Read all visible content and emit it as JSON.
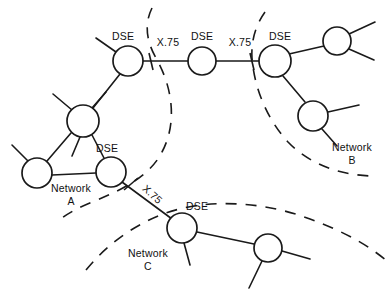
{
  "diagram": {
    "background_color": "#ffffff",
    "line_color": "#1a1a1a",
    "width": 390,
    "height": 305,
    "nodes": [
      {
        "id": "n-a-dse-top",
        "label": "DSE",
        "label_pos": "above-left",
        "cx": 128,
        "cy": 61,
        "r": 15
      },
      {
        "id": "n-a-mid",
        "label": "",
        "label_pos": "",
        "cx": 83,
        "cy": 121,
        "r": 16
      },
      {
        "id": "n-a-left",
        "label": "",
        "label_pos": "",
        "cx": 37,
        "cy": 173,
        "r": 15
      },
      {
        "id": "n-a-dse-bottom",
        "label": "DSE",
        "label_pos": "above-left",
        "cx": 111,
        "cy": 172,
        "r": 15
      },
      {
        "id": "n-relay",
        "label": "DSE",
        "label_pos": "above",
        "cx": 202,
        "cy": 61,
        "r": 14
      },
      {
        "id": "n-b-dse",
        "label": "DSE",
        "label_pos": "above-right",
        "cx": 275,
        "cy": 61,
        "r": 16
      },
      {
        "id": "n-b-top",
        "label": "",
        "label_pos": "",
        "cx": 337,
        "cy": 41,
        "r": 14
      },
      {
        "id": "n-b-low",
        "label": "",
        "label_pos": "",
        "cx": 313,
        "cy": 116,
        "r": 15
      },
      {
        "id": "n-c-dse",
        "label": "DSE",
        "label_pos": "above-right",
        "cx": 182,
        "cy": 228,
        "r": 15
      },
      {
        "id": "n-c-right",
        "label": "",
        "label_pos": "",
        "cx": 268,
        "cy": 248,
        "r": 14
      }
    ],
    "links": [
      {
        "id": "lnk-a-dse-top__a-mid",
        "from": "n-a-dse-top",
        "to": "n-a-mid",
        "label": ""
      },
      {
        "id": "lnk-a-mid__a-left",
        "from": "n-a-mid",
        "to": "n-a-left",
        "label": ""
      },
      {
        "id": "lnk-a-mid__a-dse-bottom",
        "from": "n-a-mid",
        "to": "n-a-dse-bottom",
        "label": ""
      },
      {
        "id": "lnk-a-left__a-dse-bottom",
        "from": "n-a-left",
        "to": "n-a-dse-bottom",
        "label": ""
      },
      {
        "id": "lnk-a-dse-top__relay",
        "from": "n-a-dse-top",
        "to": "n-relay",
        "label": "X.75"
      },
      {
        "id": "lnk-relay__b-dse",
        "from": "n-relay",
        "to": "n-b-dse",
        "label": "X.75"
      },
      {
        "id": "lnk-b-dse__b-top",
        "from": "n-b-dse",
        "to": "n-b-top",
        "label": ""
      },
      {
        "id": "lnk-b-dse__b-low",
        "from": "n-b-dse",
        "to": "n-b-low",
        "label": ""
      },
      {
        "id": "lnk-a-dse-bottom__c-dse",
        "from": "n-a-dse-bottom",
        "to": "n-c-dse",
        "label": "X.75"
      },
      {
        "id": "lnk-c-dse__c-right",
        "from": "n-c-dse",
        "to": "n-c-right",
        "label": ""
      }
    ],
    "link_labels": [
      {
        "id": "x75-top-left",
        "text": "X.75",
        "x": 168,
        "y": 46,
        "rotation": 0
      },
      {
        "id": "x75-top-right",
        "text": "X.75",
        "x": 240,
        "y": 46,
        "rotation": 0
      },
      {
        "id": "x75-diagonal",
        "text": "X.75",
        "x": 150,
        "y": 197,
        "rotation": 42
      }
    ],
    "node_labels": [
      {
        "id": "dse-a-top",
        "text": "DSE",
        "x": 123,
        "y": 40
      },
      {
        "id": "dse-a-bottom",
        "text": "DSE",
        "x": 107,
        "y": 152
      },
      {
        "id": "dse-relay",
        "text": "DSE",
        "x": 202,
        "y": 40
      },
      {
        "id": "dse-b",
        "text": "DSE",
        "x": 280,
        "y": 40
      },
      {
        "id": "dse-c",
        "text": "DSE",
        "x": 197,
        "y": 210
      }
    ],
    "cloud_labels": [
      {
        "id": "network-a-label",
        "name": "Network",
        "letter": "A",
        "x": 71,
        "y": 192
      },
      {
        "id": "network-b-label",
        "name": "Network",
        "letter": "B",
        "x": 352,
        "y": 151
      },
      {
        "id": "network-c-label",
        "name": "Network",
        "letter": "C",
        "x": 148,
        "y": 257
      }
    ],
    "clouds": [
      {
        "id": "cloud-network-a",
        "name": "Network A"
      },
      {
        "id": "cloud-network-b",
        "name": "Network B"
      },
      {
        "id": "cloud-network-c",
        "name": "Network C"
      }
    ]
  }
}
